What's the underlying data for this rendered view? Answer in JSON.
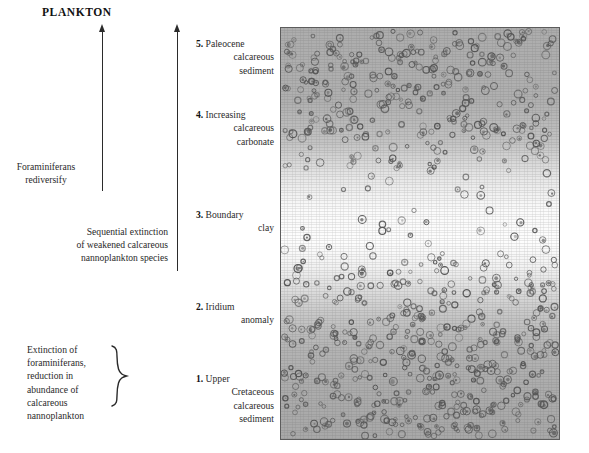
{
  "figure": {
    "title": "PLANKTON"
  },
  "arrows": [
    {
      "name": "plankton-recovery-arrow",
      "direction": "up"
    },
    {
      "name": "stratigraphic-time-arrow",
      "direction": "up"
    }
  ],
  "annotations": [
    {
      "id": "rediversify",
      "text": "Foraminiferans\nrediversify"
    },
    {
      "id": "sequential",
      "text": "Sequential extinction\nof weakened calcareous\nnannoplankton species"
    },
    {
      "id": "extinction",
      "text": "Extinction of\nforaminiferans,\nreduction in\nabundance of\ncalcareous\nnannoplankton"
    }
  ],
  "layers": [
    {
      "number": "5.",
      "line1": "Paleocene",
      "line2": "calcareous",
      "line3": "sediment",
      "line4": ""
    },
    {
      "number": "4.",
      "line1": "Increasing",
      "line2": "calcareous",
      "line3": "carbonate",
      "line4": ""
    },
    {
      "number": "3.",
      "line1": "Boundary",
      "line2": "clay",
      "line3": "",
      "line4": ""
    },
    {
      "number": "2.",
      "line1": "Iridium",
      "line2": "anomaly",
      "line3": "",
      "line4": ""
    },
    {
      "number": "1.",
      "line1": "Upper",
      "line2": "Cretaceous",
      "line3": "calcareous",
      "line4": "sediment"
    }
  ],
  "core_image": {
    "name": "sediment-core-photograph",
    "border_color": "#5c5c5c",
    "gradient_top_color": "#adadad",
    "gradient_middle_color": "#fdfdfd",
    "gradient_bottom_color": "#a8a8a8",
    "fossil_color": "#555555"
  },
  "chart_data": {
    "type": "area",
    "title": "PLANKTON",
    "xlabel": "",
    "ylabel": "Stratigraphic position",
    "categories": [
      "1. Upper Cretaceous calcareous sediment",
      "2. Iridium anomaly",
      "3. Boundary clay",
      "4. Increasing calcareous carbonate",
      "5. Paleocene calcareous sediment"
    ],
    "series": [
      {
        "name": "Relative microfossil abundance",
        "values": [
          100,
          45,
          12,
          55,
          95
        ]
      }
    ],
    "annotations": [
      "Extinction of foraminiferans, reduction in abundance of calcareous nannoplankton",
      "Sequential extinction of weakened calcareous nannoplankton species",
      "Foraminiferans rediversify"
    ],
    "grid": false,
    "legend": "none"
  }
}
